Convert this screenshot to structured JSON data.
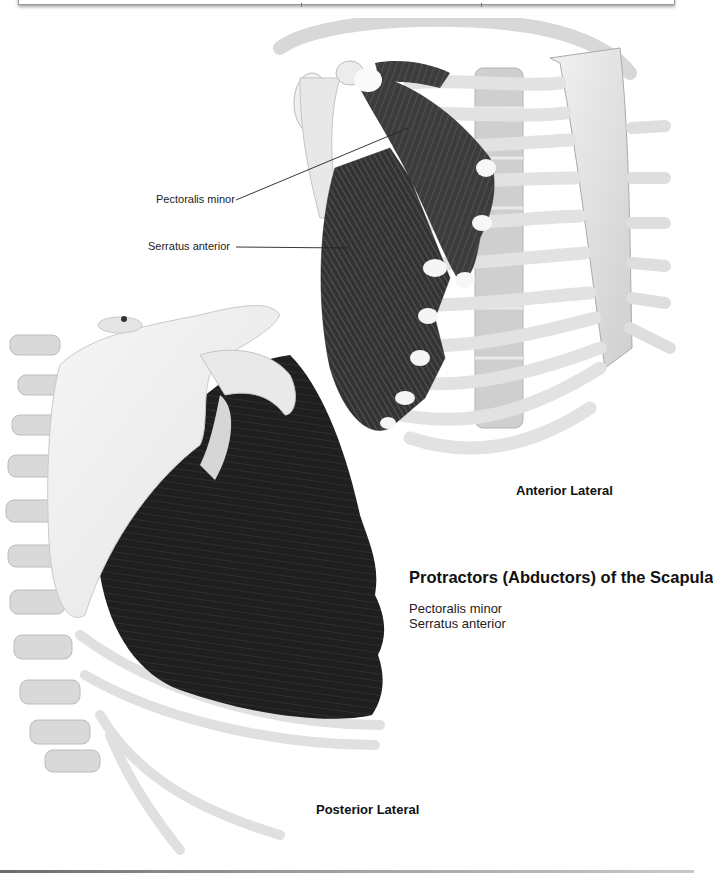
{
  "page": {
    "title": "Protractors (Abductors) of the Scapula",
    "muscles": [
      "Pectoralis minor",
      "Serratus anterior"
    ]
  },
  "figures": {
    "anterior": {
      "caption": "Anterior Lateral",
      "labels": [
        {
          "text": "Pectoralis minor"
        },
        {
          "text": "Serratus anterior"
        }
      ]
    },
    "posterior": {
      "caption": "Posterior Lateral"
    }
  },
  "colors": {
    "bone": "#e4e4e4",
    "bone_shadow": "#bdbdbd",
    "muscle": "#3a3a3a",
    "muscle_dark": "#1e1e1e",
    "tendon": "#f4f4f4"
  }
}
